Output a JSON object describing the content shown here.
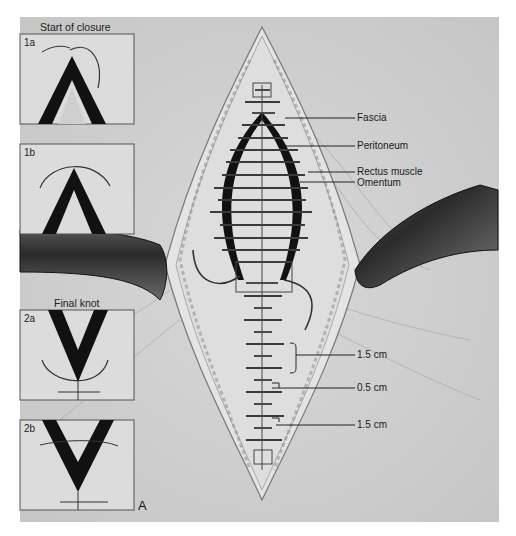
{
  "figure": {
    "panel_letter": "A",
    "colors": {
      "background": "#d2d2d2",
      "paper": "#ffffff",
      "ink": "#1a1a1a",
      "retractor": "#3a3a3a"
    },
    "insets": [
      {
        "id": "1a",
        "group_title": "Start of closure",
        "label": "1a"
      },
      {
        "id": "1b",
        "label": "1b"
      },
      {
        "id": "2a",
        "group_title": "Final knot",
        "label": "2a"
      },
      {
        "id": "2b",
        "label": "2b"
      }
    ],
    "layer_labels": [
      {
        "text": "Fascia"
      },
      {
        "text": "Peritoneum"
      },
      {
        "text": "Rectus muscle"
      },
      {
        "text": "Omentum"
      }
    ],
    "measurements": [
      {
        "text": "1.5 cm"
      },
      {
        "text": "0.5 cm"
      },
      {
        "text": "1.5 cm"
      }
    ]
  }
}
